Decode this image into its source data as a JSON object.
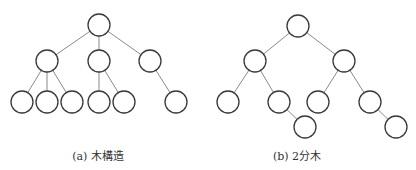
{
  "figures": [
    {
      "id": "a",
      "caption": "(a) 木構造",
      "caption_x": 98,
      "nodes": [
        {
          "x": 99,
          "y": 25
        },
        {
          "x": 47,
          "y": 61
        },
        {
          "x": 99,
          "y": 61
        },
        {
          "x": 150,
          "y": 61
        },
        {
          "x": 22,
          "y": 102
        },
        {
          "x": 47,
          "y": 102
        },
        {
          "x": 72,
          "y": 102
        },
        {
          "x": 99,
          "y": 102
        },
        {
          "x": 124,
          "y": 102
        },
        {
          "x": 176,
          "y": 102
        }
      ],
      "edges": [
        [
          0,
          1
        ],
        [
          0,
          2
        ],
        [
          0,
          3
        ],
        [
          1,
          4
        ],
        [
          1,
          5
        ],
        [
          1,
          6
        ],
        [
          2,
          7
        ],
        [
          2,
          8
        ],
        [
          3,
          9
        ]
      ]
    },
    {
      "id": "b",
      "caption": "(b) 2分木",
      "caption_x": 297,
      "nodes": [
        {
          "x": 298,
          "y": 26
        },
        {
          "x": 255,
          "y": 61
        },
        {
          "x": 344,
          "y": 61
        },
        {
          "x": 228,
          "y": 102
        },
        {
          "x": 279,
          "y": 102
        },
        {
          "x": 318,
          "y": 102
        },
        {
          "x": 370,
          "y": 102
        },
        {
          "x": 305,
          "y": 127
        },
        {
          "x": 396,
          "y": 127
        }
      ],
      "edges": [
        [
          0,
          1
        ],
        [
          0,
          2
        ],
        [
          1,
          3
        ],
        [
          1,
          4
        ],
        [
          2,
          5
        ],
        [
          2,
          6
        ],
        [
          4,
          7
        ],
        [
          6,
          8
        ]
      ]
    }
  ],
  "style": {
    "node_radius": 11,
    "node_stroke": "#3a3a3a",
    "edge_stroke": "#8a8a8a"
  }
}
